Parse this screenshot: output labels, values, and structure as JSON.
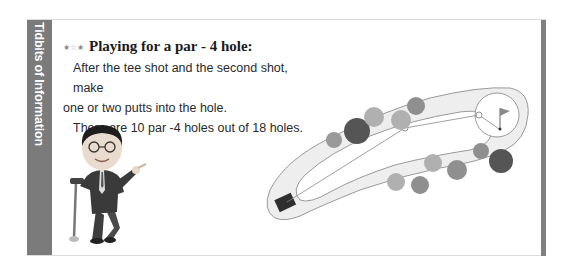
{
  "sidebar": {
    "label": "Tidbits of Information",
    "color": "#7b7b7b"
  },
  "section": {
    "rating_icon": "three-stars-icon",
    "stars": [
      "★",
      "☆",
      "★"
    ],
    "title": "Playing for a par - 4 hole:",
    "paragraphs": [
      "After the tee shot and the second shot, make one or two putts into the hole.",
      "There are 10 par -4 holes out of 18 holes."
    ],
    "line1": "After the tee shot and the second shot, make",
    "line2": "one or two putts into the hole.",
    "line3": "There are 10 par -4 holes out of 18 holes."
  },
  "illustrations": {
    "caricature": "man-leaning-on-golf-club",
    "course_diagram": "par-4-hole-layout-with-tee-fairway-trees-green-flag"
  }
}
